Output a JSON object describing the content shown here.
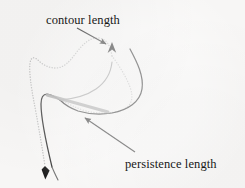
{
  "figure": {
    "background_color": "#f7f6f5",
    "width": 245,
    "height": 188,
    "labels": {
      "contour_length": "contour length",
      "persistence_length": "persistence length"
    },
    "colors": {
      "chain_solid": "#2b2b2b",
      "chain_dotted": "#b9b9b9",
      "persistence_segment": "#9a9a9a",
      "annotation_arrow": "#1a1a1a",
      "text": "#181818"
    },
    "elements": [
      {
        "name": "dotted-chain-curve",
        "role": "contour outline of the polymer chain drawn as a dotted curve",
        "style": "dotted",
        "color": "#b9b9b9"
      },
      {
        "name": "solid-chain-curve",
        "role": "polymer chain backbone drawn as a solid curve",
        "style": "solid",
        "color": "#2b2b2b"
      },
      {
        "name": "persistence-segment",
        "role": "thick straight grey segment indicating the persistence length",
        "style": "solid-thick",
        "color": "#9a9a9a"
      },
      {
        "name": "contour-length-arrow",
        "role": "annotation arrow from the contour length label to the chain",
        "color": "#1a1a1a"
      },
      {
        "name": "persistence-length-arrow",
        "role": "annotation arrow from the persistence length label to the grey segment",
        "color": "#1a1a1a"
      },
      {
        "name": "chain-arrowhead-top",
        "role": "arrowhead on the chain pointing up at the top of the figure",
        "color": "#1a1a1a"
      },
      {
        "name": "chain-arrowhead-bottom",
        "role": "arrowhead on the chain pointing down at the bottom left",
        "color": "#1a1a1a"
      }
    ]
  }
}
